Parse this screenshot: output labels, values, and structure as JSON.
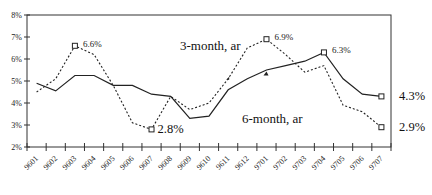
{
  "chart_data": {
    "type": "line",
    "title": "",
    "xlabel": "",
    "ylabel": "",
    "ylim": [
      2,
      8
    ],
    "yticks": [
      "2%",
      "3%",
      "4%",
      "5%",
      "6%",
      "7%",
      "8%"
    ],
    "categories": [
      "9601",
      "9602",
      "9603",
      "9604",
      "9605",
      "9606",
      "9607",
      "9608",
      "9609",
      "9610",
      "9611",
      "9612",
      "9701",
      "9702",
      "9703",
      "9704",
      "9705",
      "9706",
      "9707"
    ],
    "series": [
      {
        "name": "3-month, ar",
        "style": "dashed",
        "values": [
          4.5,
          5.1,
          6.6,
          6.2,
          4.8,
          3.1,
          2.8,
          4.3,
          3.7,
          4.0,
          5.1,
          6.5,
          6.9,
          6.2,
          5.4,
          5.7,
          3.9,
          3.6,
          2.9
        ]
      },
      {
        "name": "6-month, ar",
        "style": "solid",
        "values": [
          4.9,
          4.55,
          5.25,
          5.25,
          4.8,
          4.8,
          4.4,
          4.3,
          3.3,
          3.4,
          4.6,
          5.1,
          5.5,
          5.7,
          5.9,
          6.3,
          5.1,
          4.4,
          4.3
        ]
      }
    ],
    "annotations": [
      {
        "series": "3-month, ar",
        "category": "9603",
        "text": "6.6%",
        "size": "small"
      },
      {
        "series": "3-month, ar",
        "category": "9607",
        "text": "2.8%",
        "size": "large"
      },
      {
        "series": "3-month, ar",
        "category": "9701",
        "text": "6.9%",
        "size": "small"
      },
      {
        "series": "6-month, ar",
        "category": "9704",
        "text": "6.3%",
        "size": "small"
      },
      {
        "series": "6-month, ar",
        "category": "9707",
        "text": "4.3%",
        "size": "large"
      },
      {
        "series": "3-month, ar",
        "category": "9707",
        "text": "2.9%",
        "size": "large"
      }
    ],
    "series_labels": [
      {
        "text": "3-month, ar",
        "x": 180,
        "y": 50
      },
      {
        "text": "6-month, ar",
        "x": 242,
        "y": 123
      }
    ],
    "grid": false,
    "legend": "inline labels",
    "frame": true
  },
  "page": {
    "page_number": "155"
  }
}
